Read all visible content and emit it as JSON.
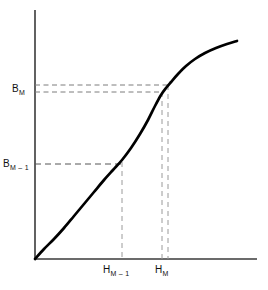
{
  "figure": {
    "background_color": "#ffffff",
    "curve_color": "#000000",
    "axis_color": "#3a3a3a",
    "dashed_color": "#8a8a8a",
    "dashed_color_dark": "#555555"
  },
  "labels": {
    "b_m": {
      "base": "B",
      "sub": "M"
    },
    "b_m_minus_1": {
      "base": "B",
      "sub": "M – 1"
    },
    "h_m": {
      "base": "H",
      "sub": "M"
    },
    "h_m_minus_1": {
      "base": "H",
      "sub": "M – 1"
    }
  },
  "chart_data": {
    "type": "line",
    "title": "",
    "xlabel": "",
    "ylabel": "",
    "grid": false,
    "legend": null,
    "axes": {
      "origin_px": [
        35,
        259
      ],
      "x_axis_end_px": [
        257,
        259
      ],
      "y_axis_end_px": [
        35,
        10
      ],
      "xlim_px": [
        35,
        257
      ],
      "ylim_px": [
        259,
        10
      ]
    },
    "series": [
      {
        "name": "magnetization-curve",
        "description": "S-shaped B-H saturation curve",
        "points_px": [
          [
            35,
            259
          ],
          [
            44,
            249
          ],
          [
            54,
            239
          ],
          [
            64,
            228
          ],
          [
            74,
            216
          ],
          [
            84,
            204
          ],
          [
            94,
            192
          ],
          [
            104,
            180
          ],
          [
            113,
            170
          ],
          [
            122,
            160
          ],
          [
            131,
            148
          ],
          [
            140,
            134
          ],
          [
            148,
            120
          ],
          [
            155,
            106
          ],
          [
            161,
            95
          ],
          [
            166,
            88
          ],
          [
            171,
            82
          ],
          [
            178,
            74
          ],
          [
            186,
            66
          ],
          [
            195,
            59
          ],
          [
            205,
            53
          ],
          [
            216,
            48
          ],
          [
            227,
            44
          ],
          [
            237,
            41
          ]
        ]
      }
    ],
    "annotations": [
      {
        "name": "b-m-upper-dashed",
        "kind": "horizontal-dashed",
        "y_px": 85,
        "x_start_px": 35,
        "x_end_px": 168
      },
      {
        "name": "b-m-lower-dashed",
        "kind": "horizontal-dashed",
        "y_px": 92,
        "x_start_px": 35,
        "x_end_px": 163
      },
      {
        "name": "b-m-minus-1-dashed",
        "kind": "horizontal-dashed",
        "y_px": 164,
        "x_start_px": 35,
        "x_end_px": 124
      },
      {
        "name": "h-m-minus-1-dashed",
        "kind": "vertical-dashed",
        "x_px": 122,
        "y_start_px": 162,
        "y_end_px": 259
      },
      {
        "name": "h-m-left-dashed",
        "kind": "vertical-dashed",
        "x_px": 162,
        "y_start_px": 92,
        "y_end_px": 259
      },
      {
        "name": "h-m-right-dashed",
        "kind": "vertical-dashed",
        "x_px": 168,
        "y_px_start": 85,
        "y_start_px": 85,
        "y_end_px": 259
      }
    ]
  }
}
